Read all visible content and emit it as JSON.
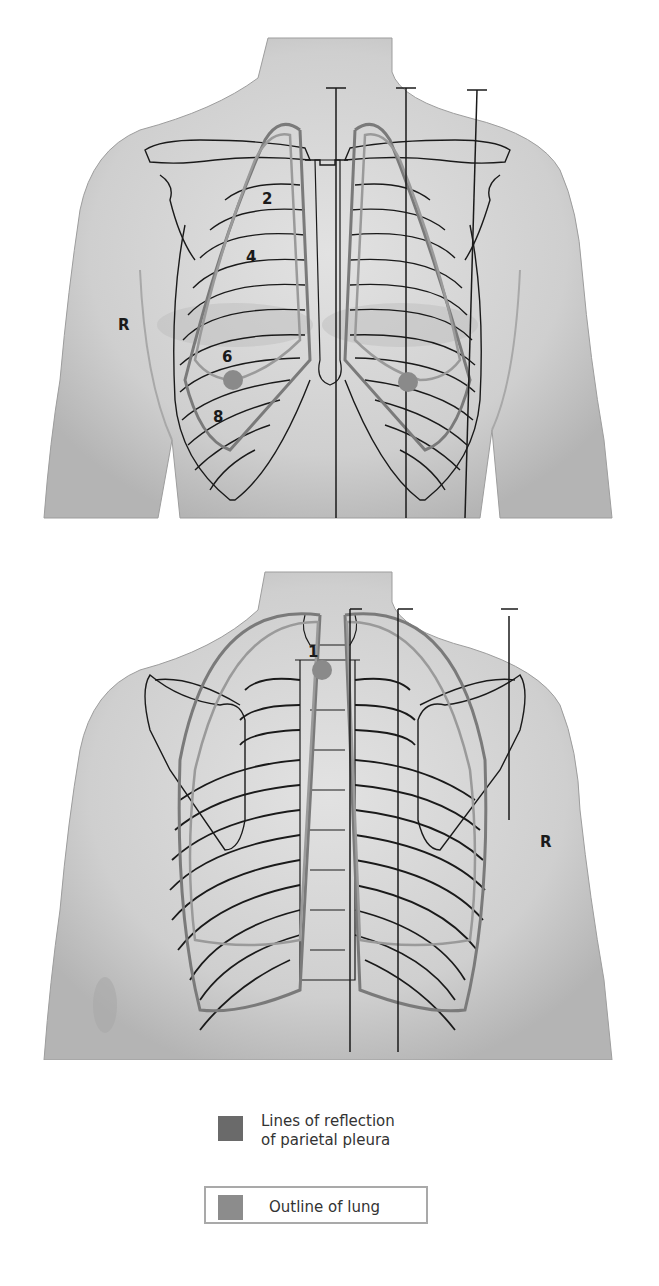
{
  "figures": {
    "anterior": {
      "view": "anterior thorax",
      "side_label": "R",
      "rib_labels": [
        "2",
        "4",
        "6",
        "8"
      ],
      "markers": 2
    },
    "posterior": {
      "view": "posterior thorax",
      "side_label": "R",
      "vertebra_label": "1",
      "markers": 1
    }
  },
  "legend": {
    "items": [
      {
        "label_line1": "Lines of reflection",
        "label_line2": "of parietal pleura",
        "color": "#6a6a6a"
      },
      {
        "label": "Outline of lung",
        "color": "#8c8c8c"
      }
    ]
  },
  "colors": {
    "skin": "#c8c8c8",
    "skin_shadow": "#a9a9a9",
    "bone_line": "#1a1a1a",
    "pleura": "#7a7a7a",
    "lung": "#9a9a9a",
    "marker": "#8a8a8a"
  }
}
